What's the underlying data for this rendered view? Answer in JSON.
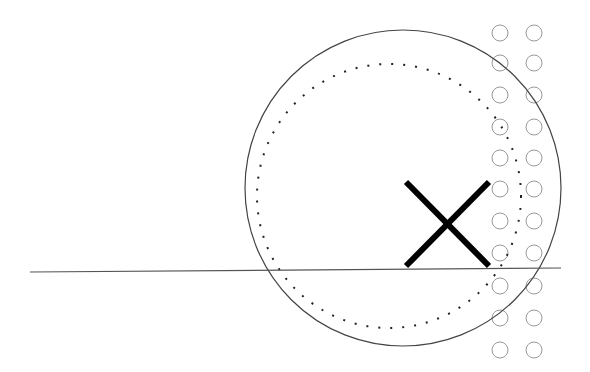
{
  "canvas": {
    "width": 590,
    "height": 372,
    "background": "#ffffff"
  },
  "colors": {
    "stroke": "#444444",
    "dotted": "#222222",
    "small_circle": "#999999",
    "x_mark": "#000000",
    "line": "#555555"
  },
  "shapes": {
    "large_circle": {
      "cx": 403,
      "cy": 188,
      "r": 158
    },
    "dotted_circle": {
      "cx": 389,
      "cy": 196,
      "r": 132
    },
    "horizontal_line": {
      "x1": 30,
      "y1": 272,
      "x2": 561,
      "y2": 268
    },
    "x_mark": {
      "x1": 406,
      "y1": 182,
      "x2": 489,
      "y2": 266
    },
    "small_circle_grid": {
      "columns_x": [
        500,
        534
      ],
      "rows_y": [
        33,
        63,
        95,
        127,
        158,
        189,
        221,
        253,
        286,
        318,
        350
      ],
      "r": 8
    }
  }
}
